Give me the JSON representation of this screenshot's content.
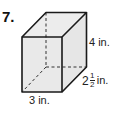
{
  "problem": {
    "number": "7."
  },
  "figure": {
    "type": "rectangular-prism",
    "fill_color": "#e9e9e9",
    "stroke_color": "#222222",
    "dimensions": {
      "height": "4 in.",
      "width": "3 in.",
      "depth_whole": "2",
      "depth_numerator": "1",
      "depth_denominator": "2",
      "depth_unit": "in."
    }
  }
}
